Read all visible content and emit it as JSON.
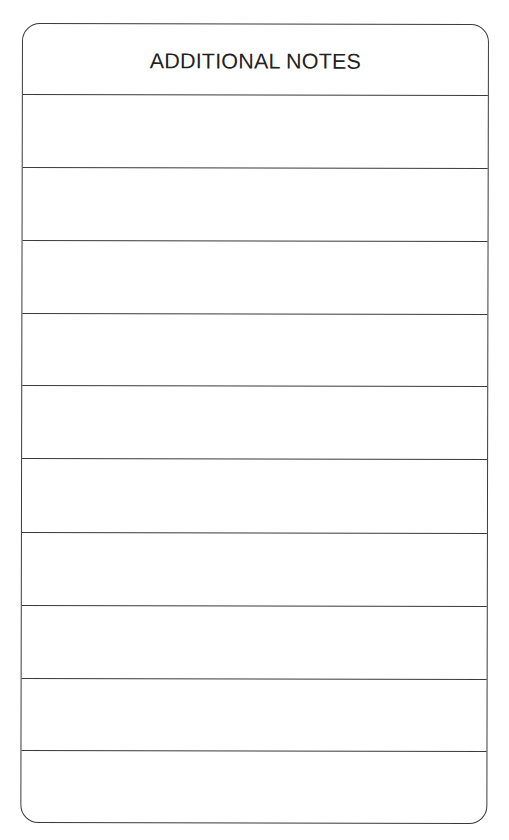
{
  "form": {
    "title": "ADDITIONAL NOTES",
    "rows": [
      {
        "value": ""
      },
      {
        "value": ""
      },
      {
        "value": ""
      },
      {
        "value": ""
      },
      {
        "value": ""
      },
      {
        "value": ""
      },
      {
        "value": ""
      },
      {
        "value": ""
      },
      {
        "value": ""
      },
      {
        "value": ""
      }
    ],
    "line_color": "#3a3a3a",
    "text_color": "#222222"
  }
}
